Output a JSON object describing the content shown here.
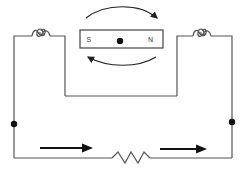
{
  "diagram": {
    "title": "",
    "magnet": {
      "south_label": "S",
      "north_label": "N",
      "pivot": "center-dot"
    },
    "rotation_arrows": [
      "clockwise-top-arc",
      "clockwise-bottom-arc"
    ],
    "components": [
      "left-coil",
      "right-coil",
      "resistor",
      "left-junction-dot",
      "right-junction-dot"
    ],
    "current_arrows": [
      "left-current-arrow-right",
      "right-current-arrow-right"
    ],
    "colors": {
      "wire": "#555555",
      "ink": "#111111",
      "background": "#ffffff"
    }
  }
}
